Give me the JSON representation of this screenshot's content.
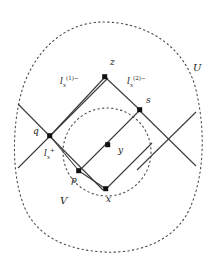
{
  "figure": {
    "background": "#ffffff",
    "stroke_color": "#3a3a3a",
    "dash_color": "#4a4a4a",
    "point_color": "#111111"
  },
  "sets": {
    "outer": {
      "name": "U",
      "label": "U",
      "style": "dashed",
      "shape": "blob"
    },
    "inner": {
      "name": "V",
      "label": "V",
      "style": "dashed",
      "shape": "circle"
    }
  },
  "points": [
    {
      "id": "z",
      "label": "z",
      "x": 105,
      "y": 77,
      "lx": 110,
      "ly": 64
    },
    {
      "id": "s",
      "label": "s",
      "x": 140,
      "y": 110,
      "lx": 146,
      "ly": 101
    },
    {
      "id": "q",
      "label": "q",
      "x": 50,
      "y": 136,
      "lx": 35,
      "ly": 129
    },
    {
      "id": "y",
      "label": "y",
      "x": 108,
      "y": 145,
      "lx": 117,
      "ly": 148
    },
    {
      "id": "p",
      "label": "p",
      "x": 79,
      "y": 171,
      "lx": 74,
      "ly": 179
    },
    {
      "id": "x",
      "label": "x",
      "x": 106,
      "y": 189,
      "lx": 108,
      "ly": 196
    }
  ],
  "line_labels": [
    {
      "id": "lx1minus",
      "base": "l",
      "sub": "x",
      "sup": "(1)−",
      "lx": 61,
      "ly": 80
    },
    {
      "id": "lx2minus",
      "base": "l",
      "sub": "x",
      "sup": "(2)−",
      "lx": 128,
      "ly": 80
    },
    {
      "id": "lxplus",
      "base": "l",
      "sub": "x",
      "sup": "+",
      "lx": 45,
      "ly": 151
    }
  ],
  "labels_flat": {
    "z": "z",
    "s": "s",
    "q": "q",
    "y": "y",
    "p": "p",
    "x": "x",
    "U": "U",
    "V": "V",
    "l": "l",
    "subx": "x",
    "sup1": "(1)−",
    "sup2": "(2)−",
    "supplus": "+"
  }
}
